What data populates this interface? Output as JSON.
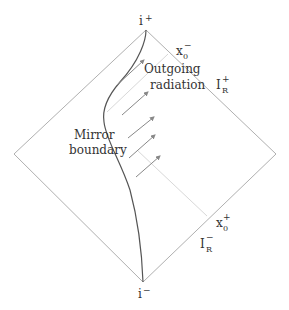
{
  "diagram": {
    "type": "penrose-diagram",
    "colors": {
      "diamond": "#b0b0b0",
      "mirror": "#555555",
      "arrows": "#888888",
      "x0_lines": "#d0d0d0",
      "text": "#333333"
    },
    "labels": {
      "i_plus": {
        "base": "i",
        "sup": "+"
      },
      "i_minus": {
        "base": "i",
        "sup": "−"
      },
      "x0_minus": {
        "base": "x",
        "sub": "0",
        "sup": "−"
      },
      "x0_plus": {
        "base": "x",
        "sub": "0",
        "sup": "+"
      },
      "scri_plus": {
        "base": "I",
        "sub": "R",
        "sup": "+"
      },
      "scri_minus": {
        "base": "I",
        "sub": "R",
        "sup": "−"
      },
      "outgoing_line1": "Outgoing",
      "outgoing_line2": "radiation",
      "mirror_line1": "Mirror",
      "mirror_line2": "boundary"
    },
    "arrow_count": 5
  }
}
